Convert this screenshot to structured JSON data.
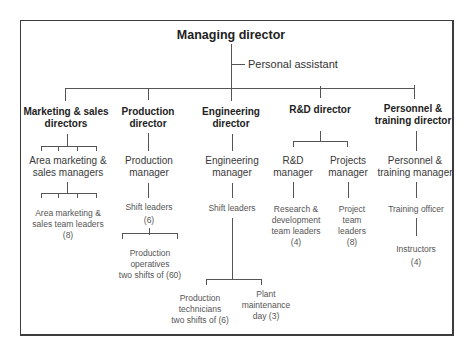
{
  "chart": {
    "top": "Managing director",
    "assistant": "Personal assistant",
    "columns": [
      {
        "director": [
          "Marketing & sales",
          "directors"
        ],
        "manager": [
          "Area marketing &",
          "sales managers"
        ],
        "leaders": [
          "Area marketing &",
          "sales team leaders",
          "(8)"
        ]
      },
      {
        "director": [
          "Production",
          "director"
        ],
        "manager": [
          "Production",
          "manager"
        ],
        "leaders": [
          "Shift leaders",
          "(6)"
        ],
        "operatives": [
          "Production",
          "operatives",
          "two shifts of (60)"
        ]
      },
      {
        "director": [
          "Engineering",
          "director"
        ],
        "manager": [
          "Engineering",
          "manager"
        ],
        "leaders": [
          "Shift leaders"
        ],
        "technicians": [
          "Production",
          "technicians",
          "two shifts of (6)"
        ],
        "maintenance": [
          "Plant",
          "maintenance",
          "day (3)"
        ]
      },
      {
        "director": [
          "R&D director"
        ],
        "rd_manager": [
          "R&D",
          "manager"
        ],
        "projects_manager": [
          "Projects",
          "manager"
        ],
        "rd_leaders": [
          "Research &",
          "development",
          "team leaders",
          "(4)"
        ],
        "project_leaders": [
          "Project",
          "team",
          "leaders",
          "(8)"
        ]
      },
      {
        "director": [
          "Personnel &",
          "training director"
        ],
        "manager": [
          "Personnel &",
          "training manager"
        ],
        "officer": [
          "Training officer"
        ],
        "instructors": [
          "Instructors",
          "(4)"
        ]
      }
    ]
  }
}
